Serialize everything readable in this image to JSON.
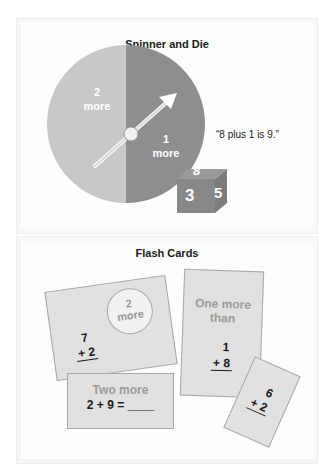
{
  "spinner_section": {
    "title": "Spinner and Die",
    "spinner": {
      "left_segment": {
        "number": "2",
        "word": "more"
      },
      "right_segment": {
        "number": "1",
        "word": "more"
      },
      "arrow_points_to": "1 more"
    },
    "die": {
      "top": "8",
      "front": "3",
      "side": "5"
    },
    "quote": "“8 plus 1 is 9.”"
  },
  "flash_cards_section": {
    "title": "Flash Cards",
    "cards": [
      {
        "circle_label_number": "2",
        "circle_label_word": "more",
        "top": "7",
        "bottom": "+ 2"
      },
      {
        "heading": "One more than",
        "heading_line1": "One more",
        "heading_line2": "than",
        "top": "1",
        "bottom": "+ 8"
      },
      {
        "heading": "Two more",
        "equation": "2 + 9 = ____"
      },
      {
        "top": "6",
        "bottom": "+ 2"
      }
    ]
  },
  "colors": {
    "spinner_light": "#c8c8c8",
    "spinner_dark": "#8e8e8e",
    "card_fill": "#e1e1e1",
    "card_heading_text": "#9b9b9b"
  }
}
